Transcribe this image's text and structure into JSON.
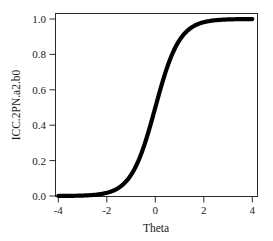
{
  "figure": {
    "background_color": "#ffffff",
    "curve_color": "#000000",
    "axis_color": "#2b2b2b",
    "text_color": "#1a1a1a"
  },
  "axes": {
    "x_title": "Theta",
    "y_title": "ICC.2PN.a2.b0",
    "x_ticks": [
      "-4",
      "-2",
      "0",
      "2",
      "4"
    ],
    "y_ticks": [
      "0.0",
      "0.2",
      "0.4",
      "0.6",
      "0.8",
      "1.0"
    ]
  },
  "chart_data": {
    "type": "line",
    "title": "",
    "xlabel": "Theta",
    "ylabel": "ICC.2PN.a2.b0",
    "xlim": [
      -4,
      4
    ],
    "ylim": [
      0,
      1
    ],
    "xticks": [
      -4,
      -2,
      0,
      2,
      4
    ],
    "yticks": [
      0.0,
      0.2,
      0.4,
      0.6,
      0.8,
      1.0
    ],
    "grid": false,
    "legend": null,
    "model": {
      "name": "2PL logistic item characteristic curve",
      "formula": "P(theta) = 1 / (1 + exp(-a * (theta - b)))",
      "discrimination_a": 2,
      "difficulty_b": 0
    },
    "series": [
      {
        "name": "ICC.2PN.a2.b0",
        "color": "#000000",
        "x": [
          -4.0,
          -3.75,
          -3.5,
          -3.25,
          -3.0,
          -2.75,
          -2.5,
          -2.25,
          -2.0,
          -1.75,
          -1.5,
          -1.25,
          -1.0,
          -0.75,
          -0.5,
          -0.25,
          0.0,
          0.25,
          0.5,
          0.75,
          1.0,
          1.25,
          1.5,
          1.75,
          2.0,
          2.25,
          2.5,
          2.75,
          3.0,
          3.25,
          3.5,
          3.75,
          4.0
        ],
        "values": [
          0.0003,
          0.0006,
          0.0009,
          0.0015,
          0.0025,
          0.0041,
          0.0067,
          0.011,
          0.018,
          0.0293,
          0.0474,
          0.0759,
          0.1192,
          0.1824,
          0.2689,
          0.3775,
          0.5,
          0.6225,
          0.7311,
          0.8176,
          0.8808,
          0.9241,
          0.9526,
          0.9707,
          0.982,
          0.989,
          0.9933,
          0.9959,
          0.9975,
          0.9985,
          0.9991,
          0.9994,
          0.9997
        ]
      }
    ]
  }
}
